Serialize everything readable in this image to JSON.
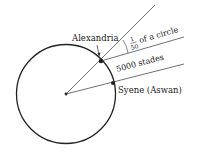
{
  "diagram": {
    "labels": {
      "alexandria": "Alexandria",
      "fraction_numerator": "1",
      "fraction_denominator": "50",
      "fraction_suffix": "of a circle",
      "distance": "5000 stades",
      "syene": "Syene (Aswan)"
    },
    "colors": {
      "stroke": "#222222",
      "background": "#ffffff"
    }
  }
}
